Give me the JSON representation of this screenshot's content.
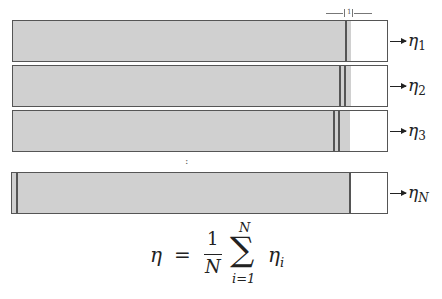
{
  "rows": [
    {
      "id": "1",
      "label": "η",
      "sub": "1"
    },
    {
      "id": "2",
      "label": "η",
      "sub": "2"
    },
    {
      "id": "3",
      "label": "η",
      "sub": "3"
    },
    {
      "id": "N",
      "label": "η",
      "sub": "N"
    }
  ],
  "dimension": {
    "label": "1"
  },
  "ellipsis": ":",
  "formula": {
    "lhs": "η",
    "equals": "=",
    "numerator": "1",
    "denominator": "N",
    "sum_symbol": "∑",
    "upper": "N",
    "lower": "i=1",
    "term": "η",
    "term_sub": "i"
  },
  "colors": {
    "fill": "#d0d0d0",
    "border": "#555555"
  }
}
